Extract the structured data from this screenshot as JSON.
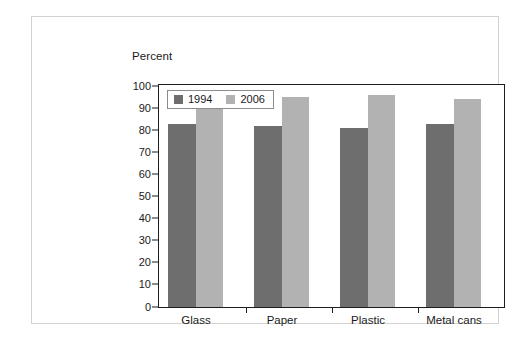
{
  "chart_data": {
    "type": "bar",
    "title": "",
    "subtitle": "",
    "xlabel": "",
    "ylabel": "Percent",
    "categories": [
      "Glass",
      "Paper",
      "Plastic",
      "Metal cans"
    ],
    "series": [
      {
        "name": "1994",
        "color": "#6e6e6e",
        "values": [
          83,
          82,
          81,
          83
        ]
      },
      {
        "name": "2006",
        "color": "#b2b2b2",
        "values": [
          95,
          95,
          96,
          94
        ]
      }
    ],
    "ylim": [
      0,
      100
    ],
    "yticks": [
      0,
      10,
      20,
      30,
      40,
      50,
      60,
      70,
      80,
      90,
      100
    ],
    "ytick_labels": [
      "0",
      "10",
      "20",
      "30",
      "40",
      "50",
      "60",
      "70",
      "80",
      "90",
      "100"
    ],
    "grid": false,
    "legend_position": "top-left",
    "legend_entries": [
      "1994",
      "2006"
    ]
  },
  "colors": {
    "series_1994": "#6e6e6e",
    "series_2006": "#b2b2b2",
    "axis": "#1d1d1d",
    "card_border": "#d2d2d2",
    "legend_border": "#8c8c8c",
    "text": "#1a1a1a",
    "background": "#ffffff"
  }
}
